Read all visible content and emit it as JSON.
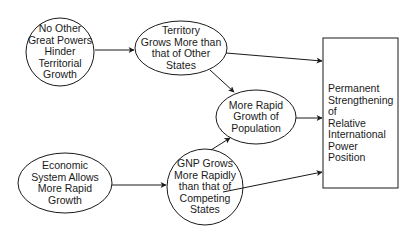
{
  "diagram": {
    "type": "causal-flow-diagram",
    "nodes": [
      {
        "id": "no_other_great_powers",
        "shape": "circle",
        "label": "No Other\nGreat Powers\nHinder\nTerritorial\nGrowth"
      },
      {
        "id": "territory_grows",
        "shape": "ellipse",
        "label": "Territory\nGrows More than\nthat of Other\nStates"
      },
      {
        "id": "more_rapid_population",
        "shape": "ellipse",
        "label": "More Rapid\nGrowth of\nPopulation"
      },
      {
        "id": "economic_system",
        "shape": "ellipse",
        "label": "Economic\nSystem Allows\nMore Rapid\nGrowth"
      },
      {
        "id": "gnp_grows",
        "shape": "circle",
        "label": "GNP Grows\nMore Rapidly\nthan that of\nCompeting\nStates"
      },
      {
        "id": "permanent_strengthening",
        "shape": "rectangle",
        "label": "Permanent\nStrengthening of\nRelative\nInternational\nPower\nPosition"
      }
    ],
    "edges": [
      {
        "from": "no_other_great_powers",
        "to": "territory_grows"
      },
      {
        "from": "territory_grows",
        "to": "permanent_strengthening"
      },
      {
        "from": "territory_grows",
        "to": "more_rapid_population"
      },
      {
        "from": "more_rapid_population",
        "to": "permanent_strengthening"
      },
      {
        "from": "economic_system",
        "to": "gnp_grows"
      },
      {
        "from": "gnp_grows",
        "to": "more_rapid_population"
      },
      {
        "from": "gnp_grows",
        "to": "permanent_strengthening"
      }
    ],
    "colors": {
      "stroke": "#1a1a1a",
      "fill": "#ffffff",
      "text": "#1a1a1a"
    }
  }
}
